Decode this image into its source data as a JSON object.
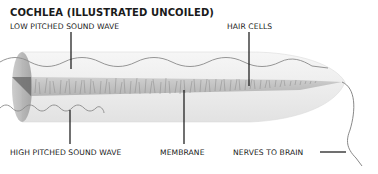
{
  "title": "COCHLEA (ILLUSTRATED UNCOILED)",
  "labels": {
    "low_wave": "LOW PITCHED SOUND WAVE",
    "hair_cells": "HAIR CELLS",
    "high_wave": "HIGH PITCHED SOUND WAVE",
    "membrane": "MEMBRANE",
    "nerves": "NERVES TO BRAIN"
  },
  "colors": {
    "tube_fill": "#ececec",
    "tube_edge": "#d4d4d4",
    "end_disc": "#a9a9a9",
    "membrane": "#bdbdbd",
    "wave": "#8a8a8a",
    "leader": "#111111"
  }
}
